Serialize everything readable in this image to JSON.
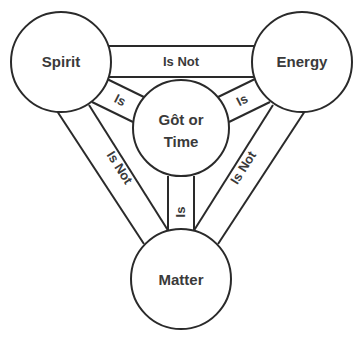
{
  "diagram": {
    "colors": {
      "stroke": "#2a2a2a",
      "text": "#3a3a3a",
      "background": "#ffffff"
    },
    "nodes": {
      "spirit": {
        "label": "Spirit"
      },
      "energy": {
        "label": "Energy"
      },
      "matter": {
        "label": "Matter"
      },
      "center": {
        "line1": "Gôt or",
        "line2": "Time"
      }
    },
    "edges": {
      "spirit_energy": {
        "label": "Is Not"
      },
      "spirit_matter": {
        "label": "Is Not"
      },
      "energy_matter": {
        "label": "Is Not"
      },
      "spirit_center": {
        "label": "Is"
      },
      "energy_center": {
        "label": "Is"
      },
      "matter_center": {
        "label": "Is"
      }
    }
  }
}
